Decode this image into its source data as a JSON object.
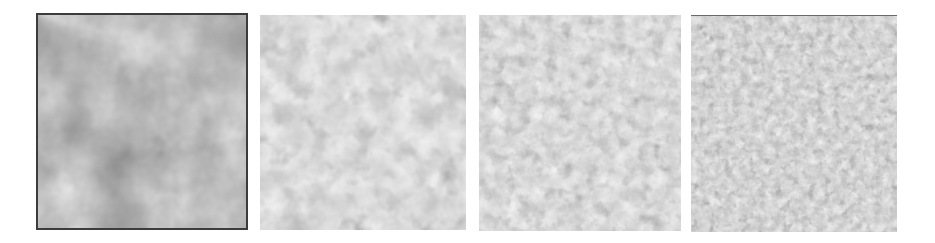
{
  "figure": {
    "panels": [
      {
        "id": "p1",
        "description": "coarse, blurry grain texture with dark framed border",
        "base_frequency": 0.018,
        "octaves": 4,
        "bright": "#d8d8d8",
        "dark": "#6e6e6e"
      },
      {
        "id": "p2",
        "description": "medium rounded grains, bright with dark boundaries",
        "base_frequency": 0.045,
        "octaves": 3,
        "bright": "#efefef",
        "dark": "#787878"
      },
      {
        "id": "p3",
        "description": "finer rounded grains",
        "base_frequency": 0.075,
        "octaves": 3,
        "bright": "#ececec",
        "dark": "#7a7a7a"
      },
      {
        "id": "p4",
        "description": "finest densely packed grains",
        "base_frequency": 0.12,
        "octaves": 3,
        "bright": "#ececec",
        "dark": "#5e5e5e"
      }
    ]
  }
}
